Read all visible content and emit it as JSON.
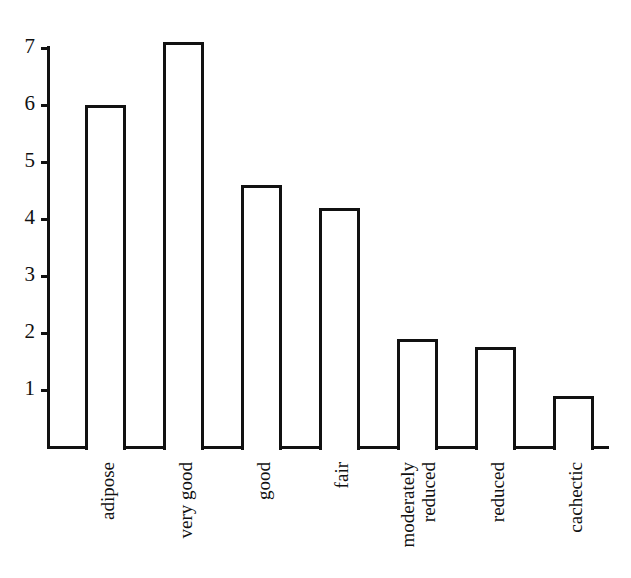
{
  "chart_data": {
    "type": "bar",
    "title": "",
    "subtitle": "",
    "xlabel": "",
    "ylabel": "",
    "categories": [
      "adipose",
      "very good",
      "good",
      "fair",
      "moderately reduced",
      "reduced",
      "cachectic"
    ],
    "category_lines": [
      [
        "adipose"
      ],
      [
        "very good"
      ],
      [
        "good"
      ],
      [
        "fair"
      ],
      [
        "moderately",
        "reduced"
      ],
      [
        "reduced"
      ],
      [
        "cachectic"
      ]
    ],
    "values": [
      6.0,
      7.1,
      4.6,
      4.2,
      1.9,
      1.75,
      0.9
    ],
    "ylim": [
      0,
      7.4
    ],
    "y_ticks": [
      1,
      2,
      3,
      4,
      5,
      6,
      7
    ],
    "y_tick_labels": [
      "1",
      "2",
      "3",
      "4",
      "5",
      "6",
      "7"
    ],
    "grid": false,
    "legend": null,
    "legend_position": "none",
    "bar_fill_color": "#ffffff",
    "bar_edge_color": "#111111",
    "axis_color": "#111111",
    "background_color": "#ffffff"
  }
}
